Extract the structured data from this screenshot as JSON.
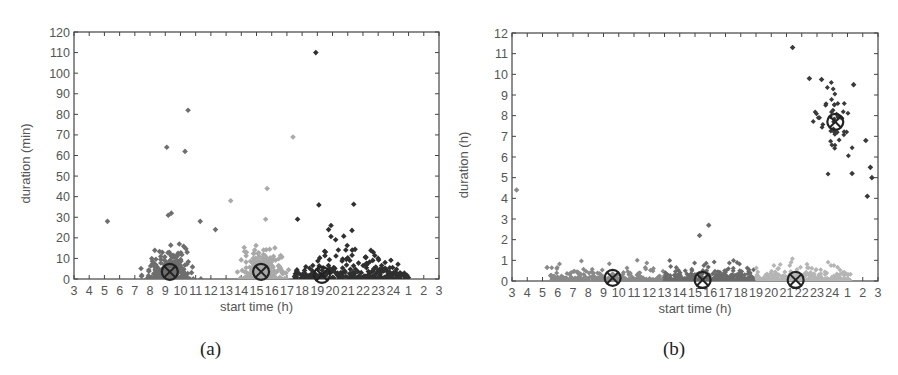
{
  "chart_data": [
    {
      "type": "scatter",
      "panel": "(a)",
      "title": "",
      "xlabel": "start time (h)",
      "ylabel": "duration (min)",
      "x_ticks": [
        "3",
        "4",
        "5",
        "6",
        "7",
        "8",
        "9",
        "10",
        "11",
        "12",
        "13",
        "14",
        "15",
        "16",
        "17",
        "18",
        "19",
        "20",
        "21",
        "22",
        "23",
        "24",
        "1",
        "2",
        "3"
      ],
      "y_ticks": [
        0,
        10,
        20,
        30,
        40,
        50,
        60,
        70,
        80,
        90,
        100,
        110,
        120
      ],
      "ylim": [
        0,
        120
      ],
      "xlim_hours_from_3": [
        0,
        24
      ],
      "grid": false,
      "legend": null,
      "clusters": [
        {
          "name": "cluster 1",
          "color": "#6e6e6e",
          "x_range_h": [
            5,
            12.5
          ],
          "centroid": {
            "x": 9.3,
            "y": 3.5
          }
        },
        {
          "name": "cluster 2",
          "color": "#a9a9a9",
          "x_range_h": [
            12.5,
            17.5
          ],
          "centroid": {
            "x": 15.3,
            "y": 3.5
          }
        },
        {
          "name": "cluster 3",
          "color": "#2f2f2f",
          "x_range_h": [
            17.5,
            25
          ],
          "centroid": {
            "x": 19.3,
            "y": 2
          }
        }
      ],
      "outliers": [
        {
          "x": 5.2,
          "y": 28,
          "cluster": 1
        },
        {
          "x": 9.1,
          "y": 64,
          "cluster": 1
        },
        {
          "x": 10.3,
          "y": 62,
          "cluster": 1
        },
        {
          "x": 10.5,
          "y": 82,
          "cluster": 1
        },
        {
          "x": 9.2,
          "y": 31,
          "cluster": 1
        },
        {
          "x": 9.4,
          "y": 32,
          "cluster": 1
        },
        {
          "x": 11.3,
          "y": 28,
          "cluster": 1
        },
        {
          "x": 12.3,
          "y": 24,
          "cluster": 1
        },
        {
          "x": 13.3,
          "y": 38,
          "cluster": 2
        },
        {
          "x": 15.7,
          "y": 44,
          "cluster": 2
        },
        {
          "x": 17.4,
          "y": 69,
          "cluster": 2
        },
        {
          "x": 15.6,
          "y": 29,
          "cluster": 2
        },
        {
          "x": 18.9,
          "y": 110,
          "cluster": 3
        },
        {
          "x": 19.1,
          "y": 36,
          "cluster": 3
        },
        {
          "x": 17.7,
          "y": 29,
          "cluster": 3
        },
        {
          "x": 19.9,
          "y": 26,
          "cluster": 3
        },
        {
          "x": 23.0,
          "y": 10,
          "cluster": 3
        }
      ]
    },
    {
      "type": "scatter",
      "panel": "(b)",
      "title": "",
      "xlabel": "start time (h)",
      "ylabel": "duration (h)",
      "x_ticks": [
        "3",
        "4",
        "5",
        "6",
        "7",
        "8",
        "9",
        "10",
        "11",
        "12",
        "13",
        "14",
        "15",
        "16",
        "17",
        "18",
        "19",
        "20",
        "21",
        "22",
        "23",
        "24",
        "1",
        "2",
        "3"
      ],
      "y_ticks": [
        0,
        1,
        2,
        3,
        4,
        5,
        6,
        7,
        8,
        9,
        10,
        11,
        12
      ],
      "ylim": [
        0,
        12
      ],
      "xlim_hours_from_3": [
        0,
        24
      ],
      "grid": false,
      "legend": null,
      "clusters": [
        {
          "name": "cluster 1",
          "color": "#8a8a8a",
          "x_range_h": [
            5.5,
            13
          ],
          "centroid": {
            "x": 9.6,
            "y": 0.15
          }
        },
        {
          "name": "cluster 2",
          "color": "#6a6a6a",
          "x_range_h": [
            13,
            19
          ],
          "centroid": {
            "x": 15.5,
            "y": 0.05
          }
        },
        {
          "name": "cluster 3",
          "color": "#b5b5b5",
          "x_range_h": [
            19,
            25.2
          ],
          "centroid": {
            "x": 21.6,
            "y": 0.05
          }
        },
        {
          "name": "cluster 4",
          "color": "#3a3a3a",
          "x_range_h": [
            22.5,
            26.5
          ],
          "centroid": {
            "x": 24.2,
            "y": 7.7
          }
        }
      ],
      "outliers": [
        {
          "x": 3.3,
          "y": 4.4,
          "cluster": 1
        },
        {
          "x": 5.3,
          "y": 0.65,
          "cluster": 1
        },
        {
          "x": 15.3,
          "y": 2.2,
          "cluster": 2
        },
        {
          "x": 15.9,
          "y": 2.7,
          "cluster": 2
        },
        {
          "x": 21.4,
          "y": 11.3,
          "cluster": 4
        },
        {
          "x": 22.5,
          "y": 9.8,
          "cluster": 4
        },
        {
          "x": 23.3,
          "y": 9.75,
          "cluster": 4
        },
        {
          "x": 25.4,
          "y": 9.5,
          "cluster": 4
        },
        {
          "x": 26.2,
          "y": 6.8,
          "cluster": 4
        },
        {
          "x": 25.3,
          "y": 5.2,
          "cluster": 4
        },
        {
          "x": 26.5,
          "y": 5.5,
          "cluster": 4
        },
        {
          "x": 26.6,
          "y": 5.0,
          "cluster": 4
        },
        {
          "x": 26.3,
          "y": 4.1,
          "cluster": 4
        }
      ]
    }
  ],
  "panels": {
    "a": {
      "caption": "(a)",
      "xlabel": "start time (h)",
      "ylabel": "duration (min)"
    },
    "b": {
      "caption": "(b)",
      "xlabel": "start time (h)",
      "ylabel": "duration (h)"
    }
  }
}
